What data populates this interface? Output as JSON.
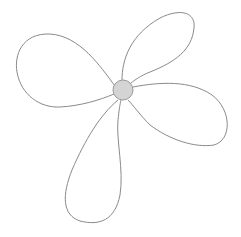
{
  "illustration": {
    "subject": "four-petal flower line drawing",
    "background": "#ffffff",
    "stroke_color": "#8a8a8a",
    "center": {
      "cx": 123,
      "cy": 90,
      "r": 10,
      "fill": "#d4d4d4",
      "stroke": "#999999"
    },
    "petals": [
      {
        "name": "left",
        "d": "M115 86 C 100 66, 80 36, 50 34 C 22 33, 14 55, 17 72 C 21 95, 40 108, 60 107 C 80 106, 100 100, 114 94"
      },
      {
        "name": "top-right",
        "d": "M122 80 C 122 60, 130 35, 160 18 C 180 8, 196 12, 194 28 C 192 50, 175 62, 150 72 C 140 76, 135 80, 131 83"
      },
      {
        "name": "right",
        "d": "M133 87 C 160 82, 190 80, 212 95 C 232 110, 232 140, 214 145 C 195 148, 170 140, 150 125 C 140 115, 133 105, 128 100"
      },
      {
        "name": "bottom",
        "d": "M118 100 C 100 115, 85 140, 72 170 C 62 195, 62 215, 80 221 C 100 226, 115 220, 120 195 C 124 170, 116 140, 118 120 C 119 110, 120 104, 121 100"
      }
    ]
  }
}
